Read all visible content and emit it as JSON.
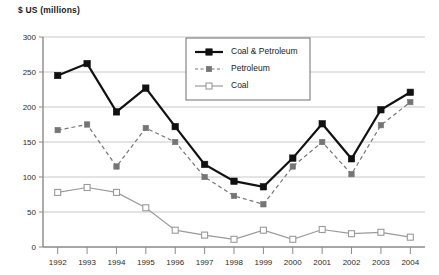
{
  "axis_title": "$ US (millions)",
  "chart_data": {
    "type": "line",
    "title": "$ US (millions)",
    "xlabel": "",
    "ylabel": "$ US (millions)",
    "ylim": [
      0,
      300
    ],
    "yticks": [
      0,
      50,
      100,
      150,
      200,
      250,
      300
    ],
    "grid": true,
    "legend_position": "top-center-inside",
    "categories": [
      "1992",
      "1993",
      "1994",
      "1995",
      "1996",
      "1997",
      "1998",
      "1999",
      "2000",
      "2001",
      "2002",
      "2003",
      "2004"
    ],
    "series": [
      {
        "name": "Coal & Petroleum",
        "marker": "filled-square",
        "line": "solid",
        "color": "#111111",
        "values": [
          245,
          262,
          193,
          227,
          172,
          118,
          94,
          86,
          127,
          176,
          126,
          196,
          221
        ]
      },
      {
        "name": "Petroleum",
        "marker": "filled-square",
        "line": "dashed",
        "color": "#757575",
        "values": [
          167,
          175,
          115,
          170,
          150,
          100,
          73,
          61,
          115,
          150,
          104,
          174,
          207
        ]
      },
      {
        "name": "Coal",
        "marker": "open-square",
        "line": "solid",
        "color": "#9a9a9a",
        "values": [
          78,
          85,
          78,
          56,
          24,
          17,
          11,
          24,
          11,
          25,
          19,
          21,
          14
        ]
      }
    ]
  },
  "legend": {
    "items": [
      {
        "label": "Coal & Petroleum"
      },
      {
        "label": "Petroleum"
      },
      {
        "label": "Coal"
      }
    ]
  },
  "colors": {
    "series_dark": "#111111",
    "series_mid": "#757575",
    "series_light": "#9a9a9a",
    "grid": "#c8c8c8",
    "axis": "#8a8a8a",
    "text": "#2b2b2b"
  }
}
